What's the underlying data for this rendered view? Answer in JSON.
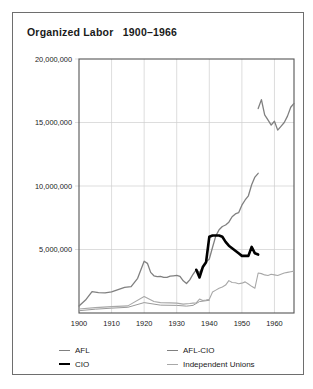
{
  "figure": {
    "title": "Organized Labor   1900–1966"
  },
  "legend": {
    "position": "bottom",
    "items": [
      {
        "label": "AFL",
        "color": "#808080",
        "width": 1.3
      },
      {
        "label": "AFL-CIO",
        "color": "#808080",
        "width": 1.3
      },
      {
        "label": "CIO",
        "color": "#000000",
        "width": 2.6
      },
      {
        "label": "Independent Unions",
        "color": "#a8a8a8",
        "width": 1.1
      }
    ]
  },
  "chart_data": {
    "type": "line",
    "title": "Organized Labor   1900–1966",
    "xlabel": "",
    "ylabel": "",
    "xlim": [
      1900,
      1966
    ],
    "ylim": [
      0,
      20000000
    ],
    "grid": true,
    "xticks": [
      1900,
      1910,
      1920,
      1930,
      1940,
      1950,
      1960
    ],
    "xtick_labels": [
      "1900",
      "1910",
      "1920",
      "1930",
      "1940",
      "1950",
      "1960"
    ],
    "yticks": [
      5000000,
      10000000,
      15000000,
      20000000
    ],
    "ytick_labels": [
      "5,000,000",
      "10,000,000",
      "15,000,000",
      "20,000,000"
    ],
    "series": [
      {
        "name": "AFL",
        "color": "#808080",
        "width": 1.3,
        "x": [
          1900,
          1902,
          1904,
          1906,
          1908,
          1910,
          1912,
          1914,
          1916,
          1918,
          1920,
          1921,
          1922,
          1923,
          1924,
          1925,
          1926,
          1927,
          1928,
          1929,
          1930,
          1931,
          1932,
          1933,
          1934,
          1935,
          1936,
          1937,
          1938,
          1939,
          1940,
          1941,
          1942,
          1943,
          1944,
          1945,
          1946,
          1947,
          1948,
          1949,
          1950,
          1951,
          1952,
          1953,
          1954,
          1955
        ],
        "y": [
          550000,
          1020000,
          1680000,
          1610000,
          1590000,
          1660000,
          1840000,
          2020000,
          2070000,
          2730000,
          4080000,
          3910000,
          3200000,
          2930000,
          2870000,
          2880000,
          2800000,
          2810000,
          2900000,
          2930000,
          2960000,
          2890000,
          2530000,
          2320000,
          2610000,
          3050000,
          3420000,
          3180000,
          3620000,
          4010000,
          4250000,
          5180000,
          6070000,
          6560000,
          6810000,
          6930000,
          7150000,
          7580000,
          7800000,
          7900000,
          8490000,
          8900000,
          9230000,
          10100000,
          10700000,
          11000000
        ]
      },
      {
        "name": "CIO",
        "color": "#000000",
        "width": 2.6,
        "x": [
          1936,
          1937,
          1938,
          1939,
          1940,
          1941,
          1942,
          1943,
          1944,
          1945,
          1946,
          1947,
          1948,
          1949,
          1950,
          1951,
          1952,
          1953,
          1954,
          1955
        ],
        "y": [
          3400000,
          2800000,
          3620000,
          4000000,
          6000000,
          6100000,
          6100000,
          6100000,
          6000000,
          5600000,
          5300000,
          5100000,
          4900000,
          4700000,
          4500000,
          4500000,
          4500000,
          5200000,
          4700000,
          4600000
        ]
      },
      {
        "name": "AFL-CIO",
        "color": "#808080",
        "width": 1.3,
        "x": [
          1955,
          1956,
          1957,
          1958,
          1959,
          1960,
          1961,
          1962,
          1963,
          1964,
          1965,
          1966
        ],
        "y": [
          16100000,
          16800000,
          15600000,
          15200000,
          14800000,
          15100000,
          14400000,
          14700000,
          15000000,
          15500000,
          16200000,
          16500000
        ]
      },
      {
        "name": "Independent Unions",
        "color": "#a8a8a8",
        "width": 1.1,
        "x": [
          1900,
          1905,
          1910,
          1915,
          1920,
          1923,
          1925,
          1928,
          1930,
          1932,
          1934,
          1935,
          1936,
          1937,
          1938,
          1939,
          1940,
          1941,
          1942,
          1943,
          1944,
          1945,
          1946,
          1947,
          1948,
          1949,
          1950,
          1951,
          1952,
          1953,
          1954,
          1955,
          1956,
          1957,
          1958,
          1959,
          1960,
          1961,
          1962,
          1963,
          1964,
          1965,
          1966
        ],
        "y": [
          320000,
          420000,
          500000,
          560000,
          1300000,
          900000,
          820000,
          800000,
          780000,
          700000,
          750000,
          780000,
          800000,
          1100000,
          980000,
          1020000,
          1080000,
          1650000,
          1800000,
          1950000,
          2050000,
          2200000,
          2550000,
          2400000,
          2380000,
          2300000,
          2350000,
          2450000,
          2280000,
          2100000,
          1950000,
          3150000,
          3100000,
          3000000,
          2950000,
          3050000,
          3000000,
          2950000,
          3050000,
          3150000,
          3200000,
          3250000,
          3300000
        ]
      }
    ],
    "secondary_low_series": {
      "name": "AFL-lower-trace",
      "color": "#9a9a9a",
      "width": 1.0,
      "x": [
        1900,
        1905,
        1910,
        1915,
        1920,
        1925,
        1930,
        1933,
        1935,
        1937,
        1940
      ],
      "y": [
        180000,
        300000,
        380000,
        450000,
        820000,
        620000,
        600000,
        540000,
        600000,
        900000,
        1000000
      ]
    }
  }
}
